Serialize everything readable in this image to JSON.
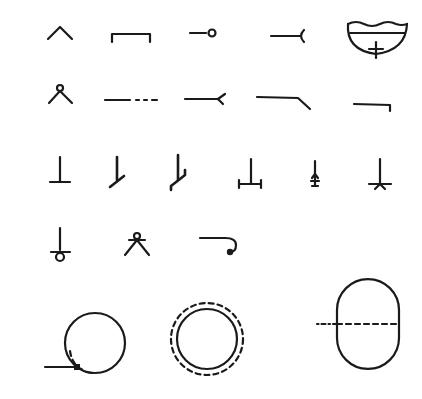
{
  "figure": {
    "background_color": "#ffffff",
    "stroke_color": "#1a1a1a",
    "rows": [
      {
        "row": 1,
        "symbols": [
          {
            "id": "caret",
            "label": "chevron / inverted V"
          },
          {
            "id": "bracket-open-bottom",
            "label": "rectangular bracket"
          },
          {
            "id": "line-with-open-circle-end",
            "label": "line ending in open circle"
          },
          {
            "id": "line-with-fork-end",
            "label": "line ending in forked cup"
          },
          {
            "id": "basin-with-wavy-top",
            "label": "bowl with wavy rim and cross"
          }
        ]
      },
      {
        "row": 2,
        "symbols": [
          {
            "id": "v-with-circle-top",
            "label": "inverted V with small circle"
          },
          {
            "id": "solid-then-dashed-line",
            "label": "solid line continuing dashed"
          },
          {
            "id": "line-with-fork-end-2",
            "label": "line ending in fork"
          },
          {
            "id": "line-with-angled-end",
            "label": "line with angled drop"
          },
          {
            "id": "line-with-right-hook",
            "label": "line with short right-angle drop"
          }
        ]
      },
      {
        "row": 3,
        "symbols": [
          {
            "id": "inverted-t",
            "label": "inverted T"
          },
          {
            "id": "stem-with-slanted-foot",
            "label": "stem with slanted foot"
          },
          {
            "id": "stem-with-stepped-foot",
            "label": "stem with stepped slanted foot"
          },
          {
            "id": "stem-on-bar-with-end-ticks",
            "label": "stem on bar with end ticks"
          },
          {
            "id": "stem-with-arrow-base",
            "label": "stem with small arrow base"
          },
          {
            "id": "stem-with-star-base",
            "label": "stem on bar with star base"
          }
        ]
      },
      {
        "row": 4,
        "symbols": [
          {
            "id": "stem-bar-with-circle",
            "label": "stem crossing bar into circle"
          },
          {
            "id": "v-with-circle-and-bar",
            "label": "inverted V with circle and crossbar"
          },
          {
            "id": "line-with-curled-end",
            "label": "line ending in curl with dot"
          }
        ]
      },
      {
        "row": 5,
        "symbols": [
          {
            "id": "circle-with-inlet",
            "label": "circle with tangent inlet line and inner dashed arc"
          },
          {
            "id": "double-circle-dashed",
            "label": "circle inside dashed circle"
          },
          {
            "id": "capsule-with-centerline",
            "label": "vertical capsule with dash-dot centerline"
          }
        ]
      }
    ]
  }
}
